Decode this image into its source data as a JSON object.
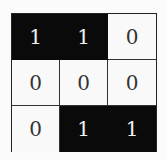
{
  "grid": {
    "rows": 3,
    "cols": 3,
    "cells": [
      [
        "1",
        "1",
        "0"
      ],
      [
        "0",
        "0",
        "0"
      ],
      [
        "0",
        "1",
        "1"
      ]
    ],
    "colors": {
      "on": "#0a0a0a",
      "off": "#f9f9f9"
    }
  }
}
